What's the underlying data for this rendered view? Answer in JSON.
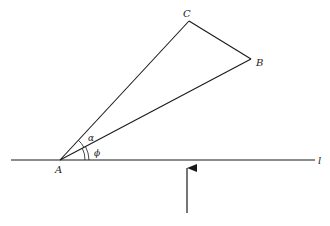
{
  "diagram": {
    "points": {
      "A": {
        "label": "A",
        "x": 60,
        "y": 160
      },
      "B": {
        "label": "B",
        "x": 251,
        "y": 59
      },
      "C": {
        "label": "C",
        "x": 189,
        "y": 21
      }
    },
    "line": {
      "label": "l"
    },
    "angles": {
      "alpha": {
        "label": "α"
      },
      "phi": {
        "label": "ϕ"
      }
    },
    "colors": {
      "stroke": "#1a1a1a"
    }
  }
}
